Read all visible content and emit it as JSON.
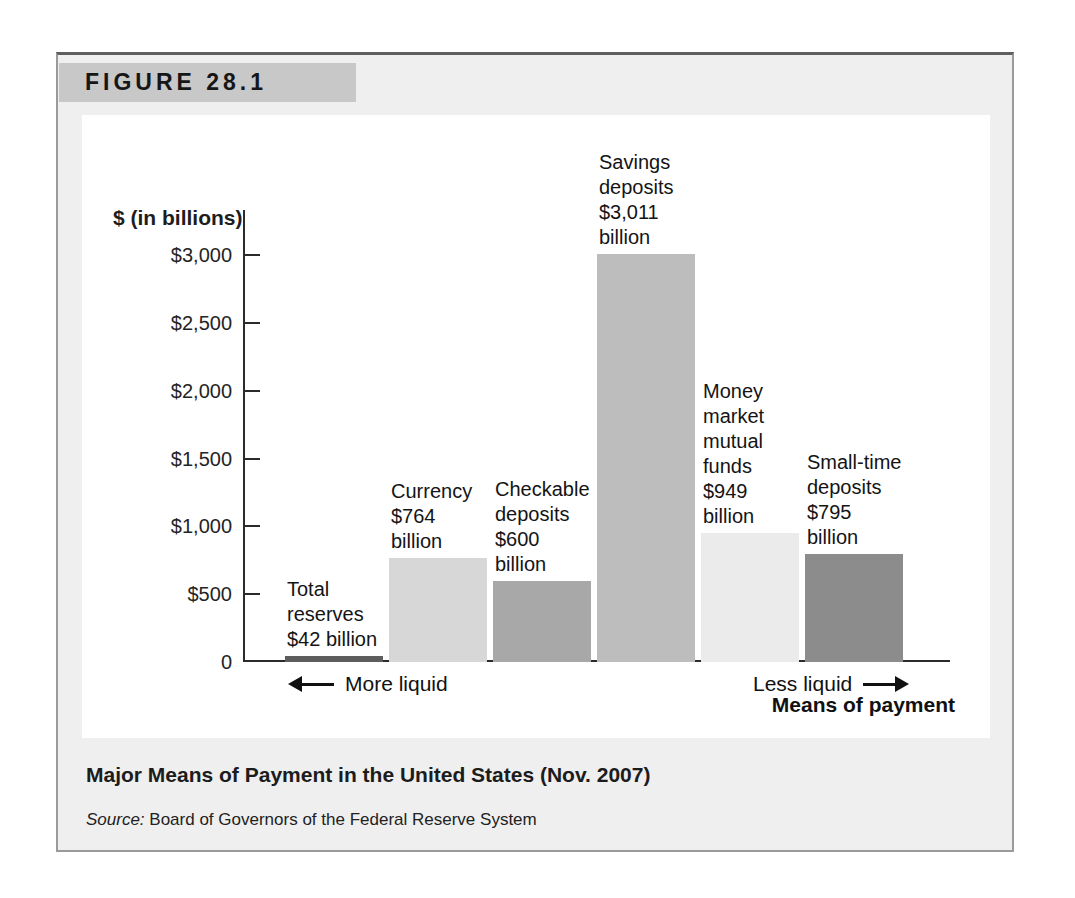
{
  "figure": {
    "label": "FIGURE 28.1",
    "caption": "Major Means of Payment in the United States (Nov. 2007)",
    "source_prefix": "Source:",
    "source_text": "Board of Governors of the Federal Reserve System",
    "colors": {
      "box_bg": "#efefef",
      "header_bg": "#c8c8c8",
      "panel_bg": "#ffffff",
      "border": "#9a9a9a",
      "border_top": "#5f5f5f",
      "axis": "#2b2b2b"
    }
  },
  "chart_data": {
    "type": "bar",
    "title": "Major Means of Payment in the United States (Nov. 2007)",
    "ylabel": "$ (in billions)",
    "xlabel": "Means of payment",
    "left_annotation": "More liquid",
    "right_annotation": "Less liquid",
    "ylim": [
      0,
      3100
    ],
    "grid": false,
    "legend": false,
    "yticks": [
      {
        "value": 0,
        "label": "0"
      },
      {
        "value": 500,
        "label": "$500"
      },
      {
        "value": 1000,
        "label": "$1,000"
      },
      {
        "value": 1500,
        "label": "$1,500"
      },
      {
        "value": 2000,
        "label": "$2,000"
      },
      {
        "value": 2500,
        "label": "$2,500"
      },
      {
        "value": 3000,
        "label": "$3,000"
      }
    ],
    "categories": [
      "Total reserves",
      "Currency",
      "Checkable deposits",
      "Savings deposits",
      "Money market mutual funds",
      "Small-time deposits"
    ],
    "values": [
      42,
      764,
      600,
      3011,
      949,
      795
    ],
    "bars": [
      {
        "category": "Total reserves",
        "value": 42,
        "label_lines": [
          "Total",
          "reserves",
          "$42 billion"
        ],
        "color": "#5d5d5d"
      },
      {
        "category": "Currency",
        "value": 764,
        "label_lines": [
          "Currency",
          "$764",
          "billion"
        ],
        "color": "#d7d7d7"
      },
      {
        "category": "Checkable deposits",
        "value": 600,
        "label_lines": [
          "Checkable",
          "deposits",
          "$600",
          "billion"
        ],
        "color": "#a8a8a8"
      },
      {
        "category": "Savings deposits",
        "value": 3011,
        "label_lines": [
          "Savings",
          "deposits",
          "$3,011",
          "billion"
        ],
        "color": "#bdbdbd"
      },
      {
        "category": "Money market mutual funds",
        "value": 949,
        "label_lines": [
          "Money",
          "market",
          "mutual",
          "funds",
          "$949",
          "billion"
        ],
        "color": "#ebebeb"
      },
      {
        "category": "Small-time deposits",
        "value": 795,
        "label_lines": [
          "Small-time",
          "deposits",
          "$795",
          "billion"
        ],
        "color": "#8c8c8c"
      }
    ]
  }
}
